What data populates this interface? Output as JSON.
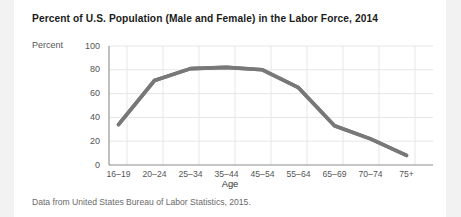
{
  "figure": {
    "title": "Percent of U.S. Population (Male and Female) in the Labor Force, 2014",
    "source_note": "Data from United States Bureau of Labor Statistics, 2015.",
    "y_axis_title": "Percent",
    "x_axis_title": "Age"
  },
  "colors": {
    "page_background": "#f2f2f2",
    "card_background": "#ffffff",
    "line": "#787878",
    "gridline": "#e6e6e6",
    "axis": "#8c8c8c",
    "title_text": "#1b1b1b",
    "tick_text": "#555555",
    "note_text": "#6a6a6a"
  },
  "chart_data": {
    "type": "line",
    "title": "Percent of U.S. Population (Male and Female) in the Labor Force, 2014",
    "xlabel": "Age",
    "ylabel": "Percent",
    "categories": [
      "16–19",
      "20–24",
      "25–34",
      "35–44",
      "45–54",
      "55–64",
      "65–69",
      "70–74",
      "75+"
    ],
    "values": [
      34,
      71,
      81,
      82,
      80,
      65,
      33,
      22,
      8
    ],
    "series": [
      {
        "name": "Percent in labor force",
        "values": [
          34,
          71,
          81,
          82,
          80,
          65,
          33,
          22,
          8
        ]
      }
    ],
    "ylim": [
      0,
      100
    ],
    "yticks": [
      0,
      20,
      40,
      60,
      80,
      100
    ],
    "ytick_labels": [
      "0",
      "20",
      "40",
      "60",
      "80",
      "100"
    ],
    "grid": true,
    "legend": "none"
  }
}
